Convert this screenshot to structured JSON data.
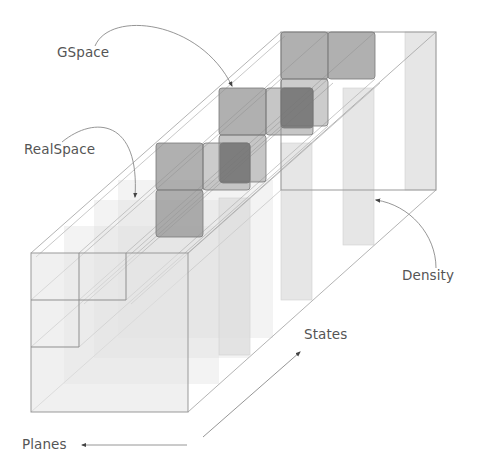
{
  "labels": {
    "gspace": "GSpace",
    "realspace": "RealSpace",
    "density": "Density",
    "states": "States",
    "planes": "Planes"
  },
  "colors": {
    "background": "#ffffff",
    "outline": "#9a9a9a",
    "outline_light": "#c4c4c4",
    "cube_dark": "#8c8c8c",
    "cube_darker": "#707070",
    "panel_light": "#e2e2e2",
    "panel_lighter": "#ececec",
    "text": "#555555",
    "arrow": "#8a8a8a"
  },
  "geometry": {
    "depth_offset": {
      "dx": 250,
      "dy": -221
    },
    "front_face": {
      "x": 31,
      "y": 253,
      "w": 157,
      "h": 159
    },
    "back_face": {
      "x": 281,
      "y": 32,
      "w": 155,
      "h": 158
    },
    "cell_size": 47
  }
}
